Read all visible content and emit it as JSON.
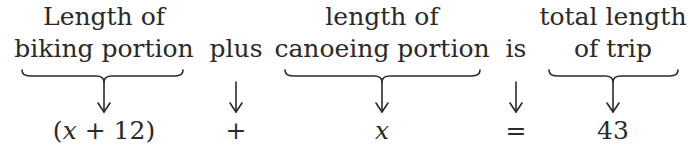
{
  "diagram": {
    "columns": [
      {
        "id": "biking",
        "label_line1": "Length of",
        "label_line2": "biking portion",
        "has_brace": true,
        "expression": "(x + 12)"
      },
      {
        "id": "plus",
        "label_line1": "",
        "label_line2": "plus",
        "has_brace": false,
        "expression": "+"
      },
      {
        "id": "canoeing",
        "label_line1": "length of",
        "label_line2": "canoeing portion",
        "has_brace": true,
        "expression": "x"
      },
      {
        "id": "is",
        "label_line1": "",
        "label_line2": "is",
        "has_brace": false,
        "expression": "="
      },
      {
        "id": "total",
        "label_line1": "total length",
        "label_line2": "of trip",
        "has_brace": true,
        "expression": "43"
      }
    ],
    "equation": "(x + 12) + x = 43",
    "stroke_color": "#2a2a2a"
  }
}
